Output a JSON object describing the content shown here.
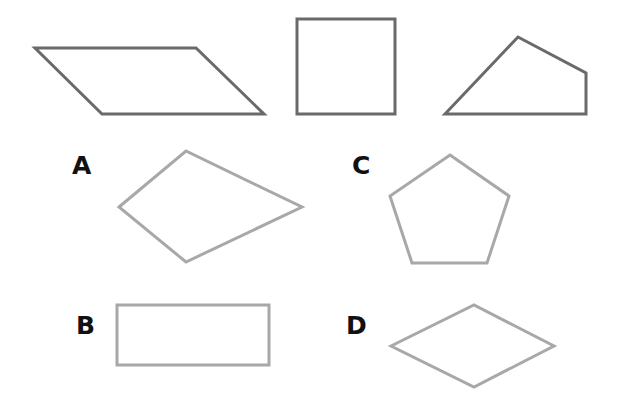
{
  "colors": {
    "reference_stroke": "#6a6a6a",
    "option_stroke": "#a8a8a8",
    "label": "#111111",
    "background": "#ffffff"
  },
  "reference_shapes": [
    {
      "name": "parallelogram",
      "points": "35,48 196,48 264,114 102,114"
    },
    {
      "name": "square",
      "points": "297,19 395,19 395,114 297,114"
    },
    {
      "name": "irregular-quadrilateral",
      "points": "445,114 518,37 586,73 586,114"
    }
  ],
  "options": [
    {
      "label": "A",
      "shape": "kite",
      "points": "119,207 186,151 302,207 186,262",
      "label_x": 72,
      "label_y": 153
    },
    {
      "label": "B",
      "shape": "rectangle",
      "points": "117,305 269,305 269,365 117,365",
      "label_x": 76,
      "label_y": 313
    },
    {
      "label": "C",
      "shape": "pentagon",
      "points": "450,155 509,196 487,263 412,263 390,196",
      "label_x": 352,
      "label_y": 153
    },
    {
      "label": "D",
      "shape": "rhombus",
      "points": "391,346 474,305 554,346 474,387",
      "label_x": 346,
      "label_y": 313
    }
  ]
}
